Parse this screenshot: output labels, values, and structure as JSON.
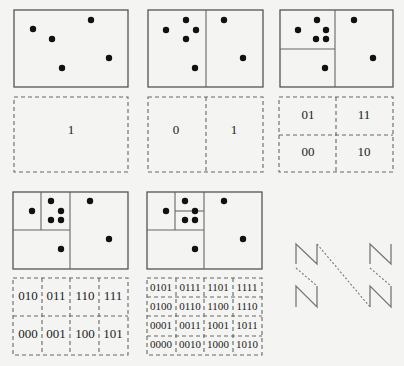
{
  "panels": [
    {
      "id": "level-0",
      "codes": [
        "1"
      ]
    },
    {
      "id": "level-1",
      "codes": [
        "0",
        "1"
      ]
    },
    {
      "id": "level-2",
      "codes": [
        "01",
        "11",
        "00",
        "10"
      ]
    },
    {
      "id": "level-3",
      "codes": [
        "010",
        "011",
        "110",
        "111",
        "000",
        "001",
        "100",
        "101"
      ]
    },
    {
      "id": "level-4",
      "codes": [
        "0101",
        "0111",
        "1101",
        "1111",
        "0100",
        "0110",
        "1100",
        "1110",
        "0001",
        "0011",
        "1001",
        "1011",
        "0000",
        "0010",
        "1000",
        "1010"
      ]
    }
  ],
  "z_order_curve": {
    "label": "Z-order traversal pattern",
    "shape_count": 4
  }
}
